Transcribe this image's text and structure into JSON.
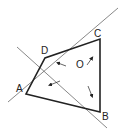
{
  "figure": {
    "points": {
      "A": {
        "label": "A",
        "x": 26,
        "y": 94
      },
      "B": {
        "label": "B",
        "x": 100,
        "y": 112
      },
      "C": {
        "label": "C",
        "x": 100,
        "y": 39
      },
      "D": {
        "label": "D",
        "x": 45,
        "y": 58
      },
      "O": {
        "label": "O",
        "x": 82,
        "y": 71
      }
    },
    "quadrilateral": "ABCD",
    "vectors": [
      "OA",
      "OB",
      "OC",
      "OD"
    ],
    "colors": {
      "stroke": "#222222",
      "thin": "#555555",
      "background": "#ffffff"
    }
  }
}
